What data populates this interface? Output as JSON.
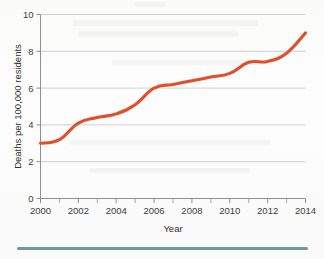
{
  "figure": {
    "background_color": "#fdfdfc",
    "rule_color": "#6e9a99",
    "rule_name": "bottom-divider-rule"
  },
  "chart_data": {
    "type": "line",
    "title": "",
    "subtitle": "",
    "xlabel": "Year",
    "ylabel": "Deaths per 100,000 residents",
    "xlim": [
      2000,
      2014
    ],
    "ylim": [
      0,
      10
    ],
    "grid": "horizontal",
    "legend": "none",
    "line_color": "#e24e2a",
    "x_tick_labels": [
      "2000",
      "2002",
      "2004",
      "2006",
      "2008",
      "2010",
      "2012",
      "2014"
    ],
    "x_major_ticks": [
      2000,
      2002,
      2004,
      2006,
      2008,
      2010,
      2012,
      2014
    ],
    "x_minor_ticks": [
      2000,
      2001,
      2002,
      2003,
      2004,
      2005,
      2006,
      2007,
      2008,
      2009,
      2010,
      2011,
      2012,
      2013,
      2014
    ],
    "y_tick_labels": [
      "0",
      "2",
      "4",
      "6",
      "8",
      "10"
    ],
    "y_major_ticks": [
      0,
      2,
      4,
      6,
      8,
      10
    ],
    "series": [
      {
        "name": "Deaths per 100,000 residents",
        "color": "#e24e2a",
        "x": [
          2000,
          2001,
          2002,
          2003,
          2004,
          2005,
          2006,
          2007,
          2008,
          2009,
          2010,
          2011,
          2012,
          2013,
          2014
        ],
        "values": [
          3.0,
          3.2,
          4.1,
          4.4,
          4.6,
          5.1,
          6.0,
          6.2,
          6.4,
          6.6,
          6.8,
          7.4,
          7.45,
          7.9,
          9.0
        ]
      }
    ]
  }
}
